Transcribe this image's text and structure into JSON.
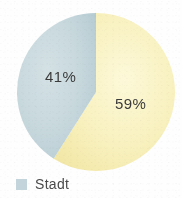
{
  "chart_data": {
    "type": "pie",
    "title": "",
    "subtitle": "",
    "xlabel": "",
    "ylabel": "",
    "grid": false,
    "legend_position": "bottom-left",
    "start_angle_deg": 0,
    "direction": "clockwise",
    "categories": [
      "Stadt",
      "Land"
    ],
    "values": [
      41,
      59
    ],
    "labels": [
      "41%",
      "59%"
    ],
    "colors": [
      "#c3d5da",
      "#f8f0bf"
    ],
    "slices": [
      {
        "name": "Stadt",
        "value": 41,
        "label": "41%",
        "color": "#c3d5da",
        "in_legend": true
      },
      {
        "name": "Land",
        "value": 59,
        "label": "59%",
        "color": "#f8f0bf",
        "in_legend": false
      }
    ]
  },
  "figure": {
    "background_color": "#fefefe",
    "outline_color": "#e6e6e6"
  },
  "pie": {
    "center_x": 96,
    "center_y": 92,
    "radius": 79,
    "left_slice": {
      "label": "41%",
      "color": "#c3d5da",
      "path": "M 96 92 L 96 13 A 79 79 0 0 0 65.0 168.7 Z"
    },
    "right_slice": {
      "label": "59%",
      "color": "#f8f0bf",
      "path": "M 96 92 L 96 13 A 79 79 0 1 1 65.0 168.7 Z"
    }
  },
  "legend": {
    "items": [
      {
        "label": "Stadt",
        "swatch_color": "#c3d5da"
      }
    ]
  }
}
